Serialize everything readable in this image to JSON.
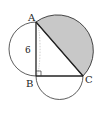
{
  "diagram": {
    "type": "geometry",
    "points": {
      "A": "A",
      "B": "B",
      "C": "C"
    },
    "side_labels": {
      "AB": "6"
    },
    "right_angle_at": "B",
    "shaded_region": "semicircle on AC outside triangle",
    "colors": {
      "shade": "#c8c8c8",
      "stroke": "#333333",
      "background": "#ffffff"
    }
  }
}
